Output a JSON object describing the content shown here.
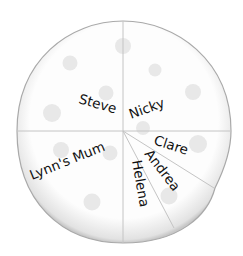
{
  "diagram": {
    "type": "pizza-share",
    "colors": {
      "crust_outline": "#b8b8b8",
      "fill": "#fbfbfb",
      "cut_line": "#c4c4c4",
      "topping": "#e6e6e6",
      "text": "#111111"
    },
    "slices": [
      {
        "name": "Steve",
        "fraction": "1/4"
      },
      {
        "name": "Nicky",
        "fraction": "1/4"
      },
      {
        "name": "Lynn's Mum",
        "fraction": "1/4"
      },
      {
        "name": "Clare",
        "fraction": "1/12"
      },
      {
        "name": "Andrea",
        "fraction": "1/12"
      },
      {
        "name": "Helena",
        "fraction": "1/12"
      }
    ]
  }
}
